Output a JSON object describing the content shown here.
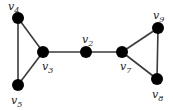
{
  "graph": {
    "nodes": [
      {
        "id": "v4",
        "label": "v",
        "sub": "4",
        "x": 18,
        "y": 18,
        "lx": 8,
        "ly": 10
      },
      {
        "id": "v5",
        "label": "v",
        "sub": "5",
        "x": 18,
        "y": 85,
        "lx": 11,
        "ly": 104
      },
      {
        "id": "v3",
        "label": "v",
        "sub": "3",
        "x": 43,
        "y": 52,
        "lx": 42,
        "ly": 70
      },
      {
        "id": "v2",
        "label": "v",
        "sub": "2",
        "x": 86,
        "y": 52,
        "lx": 82,
        "ly": 43
      },
      {
        "id": "v7",
        "label": "v",
        "sub": "7",
        "x": 122,
        "y": 52,
        "lx": 120,
        "ly": 70
      },
      {
        "id": "v9",
        "label": "v",
        "sub": "9",
        "x": 158,
        "y": 28,
        "lx": 153,
        "ly": 19
      },
      {
        "id": "v8",
        "label": "v",
        "sub": "8",
        "x": 157,
        "y": 79,
        "lx": 152,
        "ly": 98
      }
    ],
    "edges": [
      [
        "v4",
        "v5"
      ],
      [
        "v4",
        "v3"
      ],
      [
        "v5",
        "v3"
      ],
      [
        "v3",
        "v2"
      ],
      [
        "v2",
        "v7"
      ],
      [
        "v7",
        "v9"
      ],
      [
        "v7",
        "v8"
      ],
      [
        "v9",
        "v8"
      ]
    ]
  }
}
